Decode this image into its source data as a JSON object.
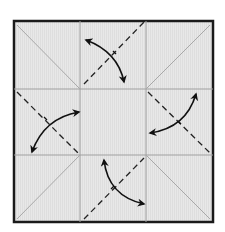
{
  "diagram": {
    "type": "origami-crease-pattern",
    "colors": {
      "background": "#ffffff",
      "paper": "#e6e6e6",
      "border": "#1a1a1a",
      "crease": "#a0a0a0",
      "fold_line": "#222222",
      "arrow": "#111111"
    },
    "paper": {
      "x": 14,
      "y": 21,
      "width": 199,
      "height": 201
    },
    "grid": {
      "vertical": [
        80,
        146
      ],
      "horizontal": [
        89,
        155
      ]
    },
    "corner_creases": [
      {
        "name": "top-left",
        "x1": 17,
        "y1": 25,
        "x2": 80,
        "y2": 89
      },
      {
        "name": "top-right",
        "x1": 210,
        "y1": 25,
        "x2": 146,
        "y2": 89
      },
      {
        "name": "bottom-left",
        "x1": 17,
        "y1": 219,
        "x2": 80,
        "y2": 155
      },
      {
        "name": "bottom-right",
        "x1": 210,
        "y1": 219,
        "x2": 146,
        "y2": 155
      }
    ],
    "dashed_folds": [
      {
        "name": "top",
        "x1": 84,
        "y1": 84,
        "x2": 144,
        "y2": 22
      },
      {
        "name": "right",
        "x1": 148,
        "y1": 92,
        "x2": 210,
        "y2": 153
      },
      {
        "name": "left",
        "x1": 17,
        "y1": 92,
        "x2": 78,
        "y2": 153
      },
      {
        "name": "bottom",
        "x1": 84,
        "y1": 219,
        "x2": 144,
        "y2": 158
      }
    ],
    "arrows": [
      {
        "name": "top",
        "d": "M86 40 Q118 52 124 82"
      },
      {
        "name": "right",
        "d": "M196 94 Q186 128 150 133"
      },
      {
        "name": "left",
        "d": "M79 112 Q44 118 32 152"
      },
      {
        "name": "bottom",
        "d": "M104 160 Q108 196 144 204"
      }
    ]
  }
}
